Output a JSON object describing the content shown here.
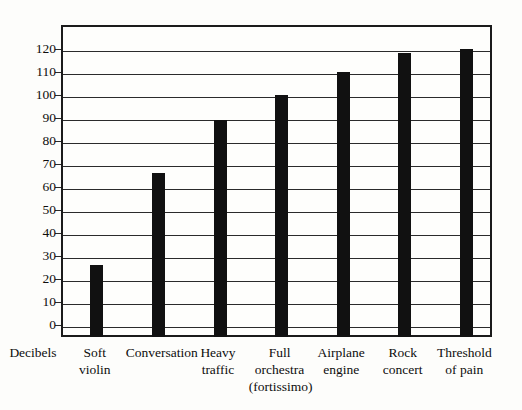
{
  "chart_data": {
    "type": "bar",
    "title": "",
    "xlabel": "Decibels",
    "ylabel": "",
    "categories": [
      "Soft violin",
      "Conversation",
      "Heavy traffic",
      "Full orchestra (fortissimo)",
      "Airplane engine",
      "Rock concert",
      "Threshold of pain"
    ],
    "category_lines": [
      [
        "Soft",
        "violin"
      ],
      [
        "Conversation"
      ],
      [
        "Heavy",
        "traffic"
      ],
      [
        "Full",
        "orchestra",
        "(fortissimo)"
      ],
      [
        "Airplane",
        "engine"
      ],
      [
        "Rock",
        "concert"
      ],
      [
        "Threshold",
        "of pain"
      ]
    ],
    "values": [
      27,
      67,
      90,
      101,
      111,
      119,
      121
    ],
    "ylim": [
      0,
      128
    ],
    "yticks": [
      0,
      10,
      20,
      30,
      40,
      50,
      60,
      70,
      80,
      90,
      100,
      110,
      120
    ],
    "ytick_labels": [
      "0",
      "10",
      "20",
      "30",
      "40",
      "50",
      "60",
      "70",
      "80",
      "90",
      "100",
      "110",
      "120"
    ],
    "grid": true,
    "legend": false,
    "bar_color": "#111111",
    "axis_color": "#1b1b1b",
    "background_color": "#fdfdfb"
  }
}
